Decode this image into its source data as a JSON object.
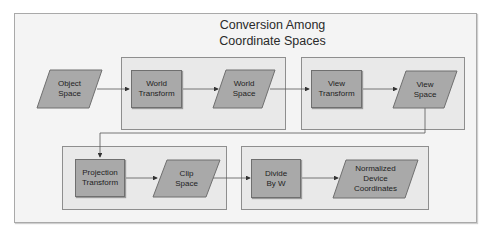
{
  "diagram": {
    "title_line1": "Conversion Among",
    "title_line2": "Coordinate Spaces",
    "nodes": {
      "object_space": {
        "line1": "Object",
        "line2": "Space",
        "shape": "parallelogram"
      },
      "world_transform": {
        "line1": "World",
        "line2": "Transform",
        "shape": "rectangle"
      },
      "world_space": {
        "line1": "World",
        "line2": "Space",
        "shape": "parallelogram"
      },
      "view_transform": {
        "line1": "View",
        "line2": "Transform",
        "shape": "rectangle"
      },
      "view_space": {
        "line1": "View",
        "line2": "Space",
        "shape": "parallelogram"
      },
      "projection_transform": {
        "line1": "Projection",
        "line2": "Transform",
        "shape": "rectangle"
      },
      "clip_space": {
        "line1": "Clip",
        "line2": "Space",
        "shape": "parallelogram"
      },
      "divide_by_w": {
        "line1": "Divide",
        "line2": "By W",
        "shape": "rectangle"
      },
      "ndc": {
        "line1": "Normalized",
        "line2": "Device",
        "line3": "Coordinates",
        "shape": "parallelogram"
      }
    },
    "edges": [
      [
        "Object Space",
        "World Transform"
      ],
      [
        "World Transform",
        "World Space"
      ],
      [
        "World Space",
        "View Transform"
      ],
      [
        "View Transform",
        "View Space"
      ],
      [
        "View Space",
        "Projection Transform"
      ],
      [
        "Projection Transform",
        "Clip Space"
      ],
      [
        "Clip Space",
        "Divide By W"
      ],
      [
        "Divide By W",
        "Normalized Device Coordinates"
      ]
    ],
    "colors": {
      "panel": "#f4f4f4",
      "group": "#e9e9e9",
      "node_fill": "#a9a9a9",
      "stroke": "#6f6f6f"
    }
  }
}
